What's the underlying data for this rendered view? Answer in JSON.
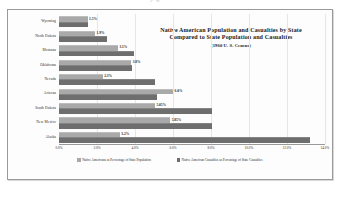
{
  "page": {
    "ghost_text": "y g"
  },
  "chart_data": {
    "type": "bar",
    "orientation": "horizontal",
    "title": "Native American Population and Casualties by State Compared to State Population and Casualties",
    "title_line1": "Native American Population and Casualties by State",
    "title_line2": "Compared to State Population and Casualties",
    "subtitle": "(1960 U. S. Census)",
    "xlabel": "",
    "ylabel": "",
    "grid": true,
    "legend_position": "bottom",
    "xlim": [
      0,
      14
    ],
    "xticks": [
      0,
      2,
      4,
      6,
      8,
      10,
      12,
      14
    ],
    "xtick_labels": [
      "0.0%",
      "2.0%",
      "4.0%",
      "6.0%",
      "8.0%",
      "10.0%",
      "12.0%",
      "14.0%"
    ],
    "categories": [
      "Wyoming",
      "North Dakota",
      "Montana",
      "Oklahoma",
      "Nevada",
      "Arizona",
      "South Dakota",
      "New Mexico",
      "Alaska"
    ],
    "series": [
      {
        "name": "Native Americans as Percentage of State Population",
        "key": "population",
        "color": "#a9a9a9",
        "values": [
          1.5,
          1.9,
          3.1,
          3.8,
          2.3,
          6.0,
          5.05,
          5.85,
          3.2
        ],
        "labels": [
          "1.5%",
          "1.9%",
          "3.1%",
          "3.8%",
          "2.3%",
          "6.0%",
          "5.05%",
          "5.85%",
          "3.2%"
        ]
      },
      {
        "name": "Native American Casualties as Percentage of State Casualties",
        "key": "casualties",
        "color": "#6e6e6e",
        "values": [
          1.55,
          2.55,
          3.95,
          3.85,
          5.05,
          5.15,
          8.05,
          8.05,
          13.2
        ],
        "labels": [
          "",
          "",
          "",
          "",
          "",
          "",
          "",
          "",
          ""
        ]
      }
    ]
  }
}
